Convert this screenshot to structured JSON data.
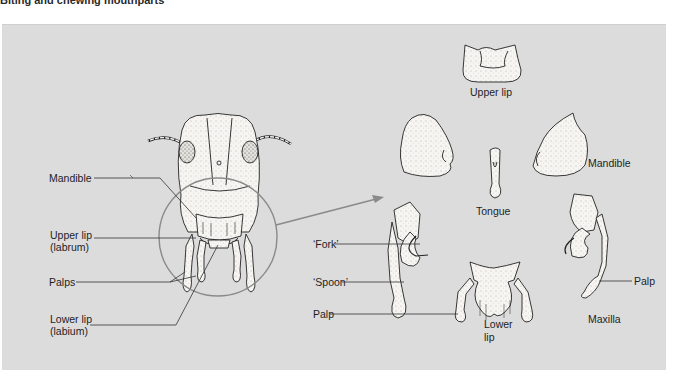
{
  "page": {
    "running_head": "Biting and chewing mouthparts"
  },
  "figure": {
    "background_color": "#dcdcdc",
    "line_color": "#333333",
    "circle_color": "#8a8a8a",
    "head_labels": {
      "mandible": "Mandible",
      "upper_lip_line1": "Upper lip",
      "upper_lip_line2": "(labrum)",
      "palps": "Palps",
      "lower_lip_line1": "Lower lip",
      "lower_lip_line2": "(labium)"
    },
    "part_labels": {
      "upper_lip": "Upper lip",
      "mandible": "Mandible",
      "tongue": "Tongue",
      "fork": "‘Fork’",
      "spoon": "‘Spoon’",
      "palp_left": "Palp",
      "palp_right": "Palp",
      "lower_lip_line1": "Lower",
      "lower_lip_line2": "lip",
      "maxilla": "Maxilla"
    }
  }
}
